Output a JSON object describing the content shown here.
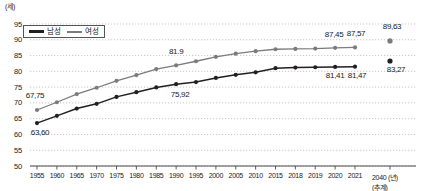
{
  "chart_data": {
    "type": "line",
    "title": "",
    "xlabel": "년",
    "ylabel": "세",
    "y_unit_label": "(세)",
    "x_unit_label": "2040 (년)",
    "x_note": "(추계)",
    "ylim": [
      50,
      95
    ],
    "yticks": [
      95,
      90,
      85,
      80,
      75,
      70,
      65,
      60,
      55,
      50
    ],
    "grid": true,
    "legend_position": "top-left",
    "categories": [
      "1955",
      "1960",
      "1965",
      "1970",
      "1975",
      "1980",
      "1985",
      "1990",
      "1995",
      "2000",
      "2005",
      "2010",
      "2015",
      "2018",
      "2019",
      "2020",
      "2021",
      "2040"
    ],
    "series": [
      {
        "name": "남성",
        "color": "#231f20",
        "values": [
          63.6,
          65.9,
          68.2,
          69.7,
          71.9,
          73.4,
          74.9,
          75.92,
          76.6,
          77.9,
          78.9,
          79.7,
          81.0,
          81.2,
          81.3,
          81.41,
          81.47,
          83.27
        ],
        "projected_index": 17
      },
      {
        "name": "여성",
        "color": "#7b7b7b",
        "values": [
          67.75,
          70.2,
          72.8,
          74.8,
          77.0,
          78.8,
          80.7,
          81.9,
          83.2,
          84.6,
          85.6,
          86.4,
          87.0,
          87.1,
          87.2,
          87.45,
          87.57,
          89.63
        ],
        "projected_index": 17
      }
    ],
    "data_labels": [
      {
        "text": "67,75",
        "series": "여성",
        "category": "1955"
      },
      {
        "text": "63,60",
        "series": "남성",
        "category": "1955"
      },
      {
        "text": "81.9",
        "series": "여성",
        "category": "1990"
      },
      {
        "text": "75,92",
        "series": "남성",
        "category": "1990"
      },
      {
        "text": "87,45",
        "series": "여성",
        "category": "2020"
      },
      {
        "text": "87,57",
        "series": "여성",
        "category": "2021"
      },
      {
        "text": "81,41",
        "series": "남성",
        "category": "2020"
      },
      {
        "text": "81,47",
        "series": "남성",
        "category": "2021"
      },
      {
        "text": "89,63",
        "series": "여성",
        "category": "2040"
      },
      {
        "text": "83,27",
        "series": "남성",
        "category": "2040"
      }
    ]
  },
  "legend": {
    "items": [
      {
        "label": "남성",
        "color": "#231f20"
      },
      {
        "label": "여성",
        "color": "#7b7b7b"
      }
    ]
  }
}
